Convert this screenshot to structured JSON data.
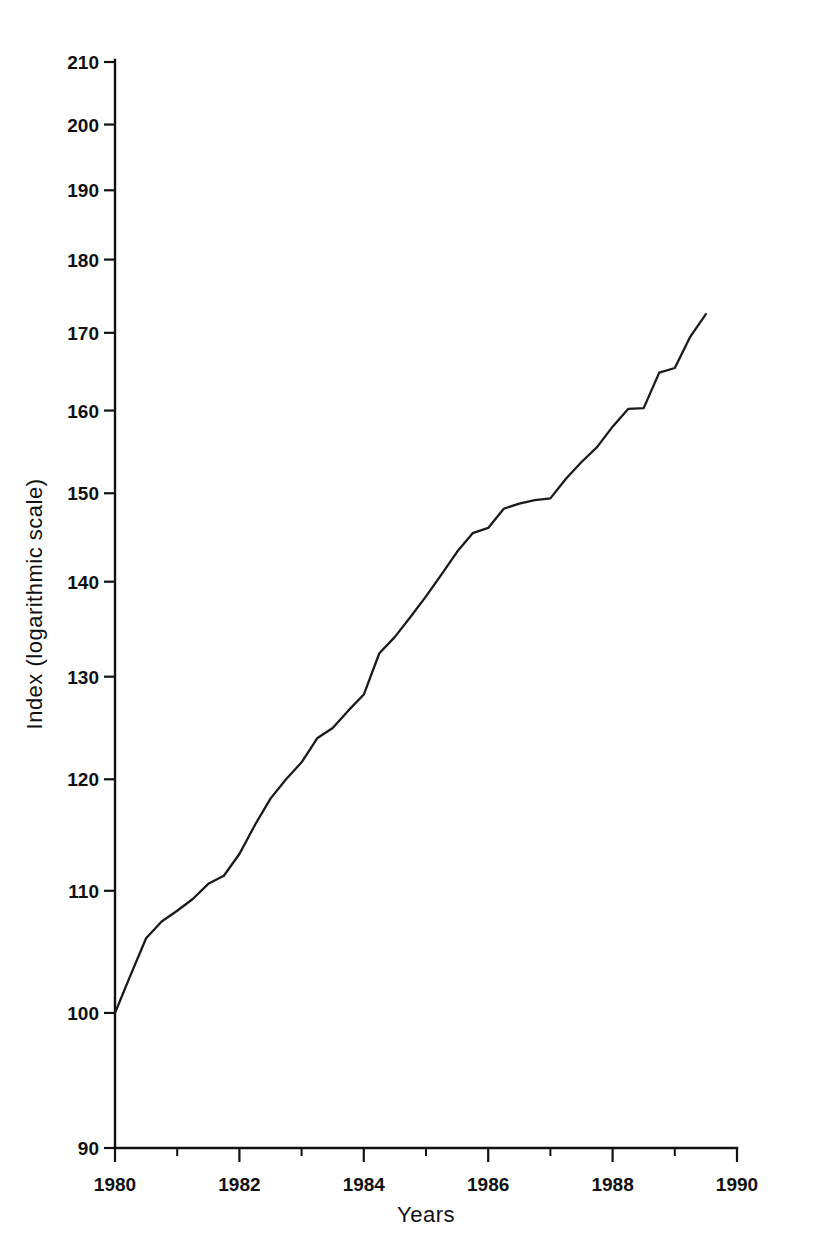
{
  "chart_data": {
    "type": "line",
    "title": "",
    "subtitle": "",
    "xlabel": "Years",
    "ylabel": "Index (logarithmic scale)",
    "yscale": "log",
    "xscale": "linear",
    "xlim": [
      1980,
      1990
    ],
    "ylim": [
      90,
      210
    ],
    "grid": false,
    "legend": false,
    "legend_position": "none",
    "line_color": "#1a1a1a",
    "x_major_ticks": [
      1980,
      1982,
      1984,
      1986,
      1988,
      1990
    ],
    "x_minor_ticks": [
      1981,
      1983,
      1985,
      1987,
      1989
    ],
    "x_tick_labels": [
      "1980",
      "1982",
      "1984",
      "1986",
      "1988",
      "1990"
    ],
    "y_ticks": [
      90,
      100,
      110,
      120,
      130,
      140,
      150,
      160,
      170,
      180,
      190,
      200,
      210
    ],
    "y_tick_labels": [
      "90",
      "100",
      "110",
      "120",
      "130",
      "140",
      "150",
      "160",
      "170",
      "180",
      "190",
      "200",
      "210"
    ],
    "series": [
      {
        "name": "Index",
        "x": [
          1980.0,
          1980.25,
          1980.5,
          1980.75,
          1981.0,
          1981.25,
          1981.5,
          1981.75,
          1982.0,
          1982.25,
          1982.5,
          1982.75,
          1983.0,
          1983.25,
          1983.5,
          1983.75,
          1984.0,
          1984.25,
          1984.5,
          1984.75,
          1985.0,
          1985.25,
          1985.5,
          1985.75,
          1986.0,
          1986.25,
          1986.5,
          1986.75,
          1987.0,
          1987.25,
          1987.5,
          1987.75,
          1988.0,
          1988.25,
          1988.5,
          1988.75,
          1989.0,
          1989.25,
          1989.5
        ],
        "y": [
          100.0,
          103.0,
          106.0,
          107.4,
          108.3,
          109.3,
          110.6,
          111.3,
          113.2,
          115.8,
          118.2,
          120.0,
          121.6,
          123.9,
          124.9,
          126.6,
          128.2,
          132.4,
          134.1,
          136.2,
          138.4,
          140.8,
          143.3,
          145.4,
          146.0,
          148.2,
          148.8,
          149.2,
          149.4,
          151.7,
          153.7,
          155.5,
          158.0,
          160.2,
          160.3,
          164.8,
          165.4,
          169.5,
          172.5
        ]
      }
    ],
    "start_value": 100,
    "end_value": 172.5,
    "start_year": 1980,
    "end_year": 1989.5,
    "annotations": []
  },
  "figure": {
    "background": "#ffffff",
    "width": 815,
    "height": 1250
  }
}
